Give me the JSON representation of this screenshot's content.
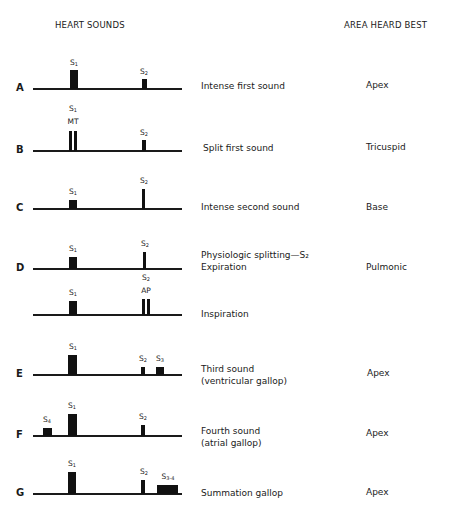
{
  "headers": {
    "left": "HEART SOUNDS",
    "right": "AREA HEARD BEST"
  },
  "rows": [
    {
      "letter": "A",
      "description": [
        "Intense first sound"
      ],
      "area": "Apex",
      "labels": [
        {
          "text": "S",
          "sub": "1"
        },
        {
          "text": "S",
          "sub": "2"
        }
      ]
    },
    {
      "letter": "B",
      "description": [
        "Split first sound"
      ],
      "area": "Tricuspid",
      "labels": [
        {
          "text": "S",
          "sub": "1"
        },
        {
          "text": "MT",
          "sub": ""
        },
        {
          "text": "S",
          "sub": "2"
        }
      ]
    },
    {
      "letter": "C",
      "description": [
        "Intense second sound"
      ],
      "area": "Base",
      "labels": [
        {
          "text": "S",
          "sub": "1"
        },
        {
          "text": "S",
          "sub": "2"
        }
      ]
    },
    {
      "letter": "D",
      "description": [
        "Physiologic splitting—S₂",
        "Expiration"
      ],
      "area": "Pulmonic",
      "labels": [
        {
          "text": "S",
          "sub": "1"
        },
        {
          "text": "S",
          "sub": "2"
        }
      ]
    },
    {
      "letter": "",
      "description": [
        "Inspiration"
      ],
      "area": "",
      "labels": [
        {
          "text": "S",
          "sub": "1"
        },
        {
          "text": "S",
          "sub": "2"
        },
        {
          "text": "AP",
          "sub": ""
        }
      ]
    },
    {
      "letter": "E",
      "description": [
        "Third sound",
        "(ventricular gallop)"
      ],
      "area": "Apex",
      "labels": [
        {
          "text": "S",
          "sub": "1"
        },
        {
          "text": "S",
          "sub": "2"
        },
        {
          "text": "S",
          "sub": "3"
        }
      ]
    },
    {
      "letter": "F",
      "description": [
        "Fourth sound",
        "(atrial gallop)"
      ],
      "area": "Apex",
      "labels": [
        {
          "text": "S",
          "sub": "4"
        },
        {
          "text": "S",
          "sub": "1"
        },
        {
          "text": "S",
          "sub": "2"
        }
      ]
    },
    {
      "letter": "G",
      "description": [
        "Summation gallop"
      ],
      "area": "Apex",
      "labels": [
        {
          "text": "S",
          "sub": "1"
        },
        {
          "text": "S",
          "sub": "2"
        },
        {
          "text": "S",
          "sub": "3-4"
        }
      ]
    }
  ]
}
